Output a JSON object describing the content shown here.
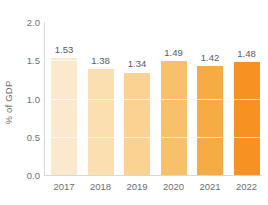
{
  "chart_data": {
    "type": "bar",
    "title": "",
    "subtitle": "",
    "xlabel": "",
    "ylabel": "% of GDP",
    "categories": [
      "2017",
      "2018",
      "2019",
      "2020",
      "2021",
      "2022"
    ],
    "values": [
      1.53,
      1.38,
      1.34,
      1.49,
      1.42,
      1.48
    ],
    "value_labels": [
      "1.53",
      "1.38",
      "1.34",
      "1.49",
      "1.42",
      "1.48"
    ],
    "ylim": [
      0.0,
      2.0
    ],
    "y_ticks": [
      0.0,
      0.5,
      1.0,
      1.5,
      2.0
    ],
    "y_tick_labels": [
      "0.0",
      "0.5",
      "1.0",
      "1.5",
      "2.0"
    ],
    "grid": true,
    "grid_color": "#ffffff",
    "legend": null,
    "legend_position": "none",
    "bar_colors": [
      "#fbe9ce",
      "#fcdfb0",
      "#fbd291",
      "#f9c06a",
      "#f7ab45",
      "#f59222"
    ],
    "axis_color": "#d7d8da",
    "label_color": "#58595b",
    "tick_color": "#6d6e71",
    "background": "#ffffff"
  }
}
